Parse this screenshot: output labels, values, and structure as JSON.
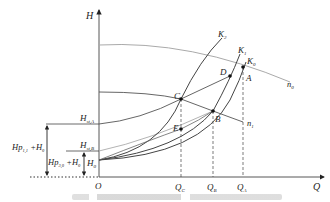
{
  "diagram": {
    "type": "pump-system characteristic diagram",
    "axes": {
      "y_label": "H",
      "x_label": "Q",
      "origin_label": "O"
    },
    "x_ticks": [
      {
        "label": "Q",
        "sub": "C"
      },
      {
        "label": "Q",
        "sub": "B"
      },
      {
        "label": "Q",
        "sub": "A"
      }
    ],
    "y_levels": [
      {
        "label": "H",
        "sub": "st,A"
      },
      {
        "label": "H",
        "sub": "st,B"
      },
      {
        "label": "H",
        "sub": "0"
      }
    ],
    "dimension_labels": [
      {
        "main": "Hp",
        "sub": "1,1",
        "rest": " +H",
        "rest_sub": "0"
      },
      {
        "main": "Hp",
        "sub": "3,0",
        "rest": " +H",
        "rest_sub": "0"
      }
    ],
    "pump_curves": [
      {
        "label": "n",
        "sub": "0"
      },
      {
        "label": "n",
        "sub": "1"
      }
    ],
    "system_curves": [
      {
        "label": "K",
        "sub": "2"
      },
      {
        "label": "K",
        "sub": "1"
      },
      {
        "label": "K",
        "sub": "0"
      }
    ],
    "points": [
      "A",
      "B",
      "C",
      "D",
      "E"
    ]
  }
}
